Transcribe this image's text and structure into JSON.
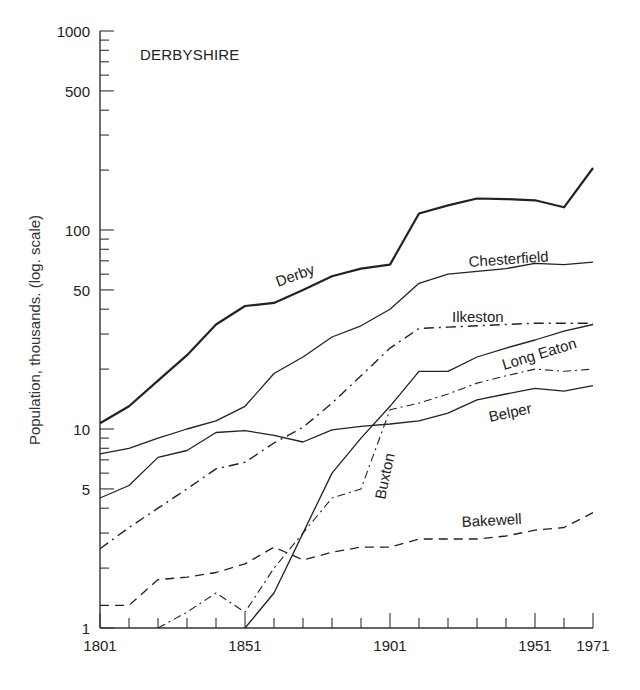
{
  "chart_data": {
    "type": "line",
    "title": "DERBYSHIRE",
    "xlabel": "",
    "ylabel": "Population, thousands. (log. scale)",
    "yscale": "log",
    "ylim": [
      1,
      1000
    ],
    "xlim": [
      1801,
      1971
    ],
    "grid": false,
    "legend": "inline labels on lines",
    "x_tick_labels": [
      "1801",
      "1851",
      "1901",
      "1951",
      "1971"
    ],
    "x_minor_ticks": [
      1811,
      1821,
      1831,
      1841,
      1861,
      1871,
      1881,
      1891,
      1911,
      1921,
      1931,
      1941,
      1961
    ],
    "y_tick_labels": [
      "1",
      "5",
      "10",
      "50",
      "100",
      "500",
      "1000"
    ],
    "x": [
      1801,
      1811,
      1821,
      1831,
      1841,
      1851,
      1861,
      1871,
      1881,
      1891,
      1901,
      1911,
      1921,
      1931,
      1941,
      1951,
      1961,
      1971
    ],
    "series": [
      {
        "name": "Derby",
        "style": "solid-thick",
        "values": [
          10.7,
          13,
          17.5,
          23.5,
          33.5,
          41.5,
          43,
          50,
          58.5,
          64,
          67,
          121,
          133,
          144,
          143,
          141,
          130,
          205
        ]
      },
      {
        "name": "Chesterfield",
        "style": "solid",
        "values": [
          7.5,
          8,
          9,
          10,
          11,
          13,
          19,
          23,
          29,
          33,
          40,
          54,
          60,
          62,
          64,
          68,
          67,
          69
        ]
      },
      {
        "name": "Ilkeston",
        "style": "dash-dot",
        "values": [
          2.5,
          3.2,
          4,
          5,
          6.3,
          6.8,
          8.5,
          10.2,
          13.5,
          18.5,
          25.5,
          32,
          32.5,
          33,
          33.5,
          34,
          34,
          34
        ]
      },
      {
        "name": "Long Eaton",
        "style": "solid",
        "values": [
          null,
          null,
          null,
          null,
          null,
          1,
          1.5,
          3,
          6,
          9,
          13,
          19.5,
          19.5,
          23,
          25.5,
          28,
          31,
          33.5
        ]
      },
      {
        "name": "Belper",
        "style": "solid",
        "values": [
          4.5,
          5.2,
          7.2,
          7.8,
          9.6,
          9.8,
          9.3,
          8.6,
          9.9,
          10.3,
          10.6,
          11,
          12,
          14,
          15,
          16,
          15.5,
          16.5
        ]
      },
      {
        "name": "Buxton",
        "style": "dash-dot-thin",
        "values": [
          null,
          null,
          1,
          1.2,
          1.5,
          1.2,
          2,
          3,
          4.5,
          5,
          12.5,
          13.5,
          15,
          17,
          18.5,
          20,
          19.5,
          20
        ]
      },
      {
        "name": "Bakewell",
        "style": "dashed",
        "values": [
          1.3,
          1.3,
          1.75,
          1.8,
          1.9,
          2.1,
          2.55,
          2.2,
          2.4,
          2.55,
          2.55,
          2.8,
          2.8,
          2.8,
          2.9,
          3.1,
          3.2,
          3.8
        ]
      }
    ]
  },
  "labels": {
    "title": "DERBYSHIRE",
    "ylabel": "Population, thousands. (log. scale)",
    "series": {
      "Derby": "Derby",
      "Chesterfield": "Chesterfield",
      "Ilkeston": "Ilkeston",
      "Long Eaton": "Long Eaton",
      "Belper": "Belper",
      "Buxton": "Buxton",
      "Bakewell": "Bakewell"
    }
  },
  "colors": {
    "line": "#222222",
    "axis": "#333333",
    "background": "#ffffff"
  }
}
